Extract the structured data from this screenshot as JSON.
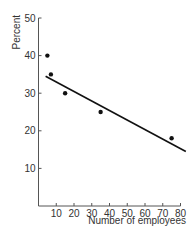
{
  "chart_data": {
    "type": "scatter",
    "title": "",
    "xlabel": "Number of employees",
    "ylabel": "Percent",
    "xlim": [
      0,
      80
    ],
    "ylim": [
      0,
      50
    ],
    "x_ticks": [
      10,
      20,
      30,
      40,
      50,
      60,
      70,
      80
    ],
    "y_ticks": [
      10,
      20,
      30,
      40,
      50
    ],
    "grid": false,
    "legend": null,
    "series": [
      {
        "name": "observations",
        "kind": "scatter",
        "points": [
          {
            "x": 5,
            "y": 40
          },
          {
            "x": 7,
            "y": 35
          },
          {
            "x": 15,
            "y": 30
          },
          {
            "x": 35,
            "y": 25
          },
          {
            "x": 75,
            "y": 18
          }
        ]
      },
      {
        "name": "fitted line",
        "kind": "line",
        "points": [
          {
            "x": 4,
            "y": 34.5
          },
          {
            "x": 83,
            "y": 14.5
          }
        ]
      }
    ]
  }
}
